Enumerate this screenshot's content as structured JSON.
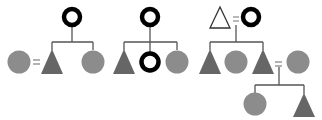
{
  "diagram": {
    "type": "kinship-pedigree",
    "colors": {
      "ego_ring": "#000000",
      "filled_shape": "#7a7a7a",
      "female_fill": "#8c8c8c",
      "male_fill": "#666666",
      "line": "#555555",
      "equals_sign": "#808080"
    },
    "symbols": {
      "ring": "ego (bold black circle outline)",
      "circle": "female (grey filled circle)",
      "triangle": "male (grey filled triangle)",
      "outline_triangle": "male (outline triangle)",
      "equals": "marriage"
    },
    "equals_label": "=",
    "panels": [
      {
        "id": "panel-1",
        "parent": "ring",
        "children": [
          "triangle",
          "circle"
        ],
        "marriages": [
          {
            "left": "circle",
            "right": "triangle"
          }
        ]
      },
      {
        "id": "panel-2",
        "parent": "ring",
        "children": [
          "triangle",
          "ring",
          "circle"
        ],
        "marriages": []
      },
      {
        "id": "panel-3",
        "parents": [
          "outline_triangle",
          "ring"
        ],
        "children": [
          "triangle",
          "circle",
          "triangle"
        ],
        "marriages": [
          {
            "left": "outline_triangle",
            "right": "ring"
          },
          {
            "left": "triangle",
            "right": "circle"
          }
        ],
        "grandchildren": [
          "circle",
          "triangle"
        ]
      }
    ]
  }
}
